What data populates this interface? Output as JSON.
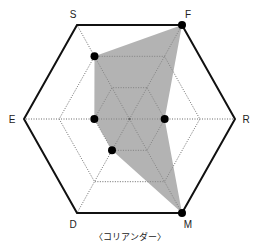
{
  "chart_data": {
    "type": "radar",
    "title": "〈コリアンダー〉",
    "axes": [
      "F",
      "R",
      "M",
      "D",
      "E",
      "S"
    ],
    "max": 3,
    "levels": 3,
    "series": [
      {
        "name": "コリアンダー",
        "values": {
          "F": 3,
          "R": 1,
          "M": 3,
          "D": 1,
          "E": 1,
          "S": 2
        },
        "fill": "#a6a6a6",
        "marker_color": "#000000"
      }
    ],
    "grid": true,
    "legend": null
  },
  "labels": {
    "S": "S",
    "F": "F",
    "R": "R",
    "M": "M",
    "D": "D",
    "E": "E",
    "caption": "〈コリアンダー〉"
  },
  "colors": {
    "outline": "#111111",
    "grid": "#888888",
    "fill": "#a6a6a6",
    "marker": "#000000"
  }
}
